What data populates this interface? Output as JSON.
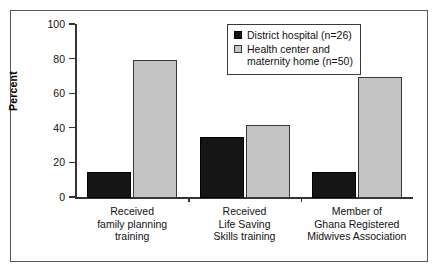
{
  "chart_data": {
    "type": "bar",
    "title": "",
    "xlabel": "",
    "ylabel": "Percent",
    "ylim": [
      0,
      100
    ],
    "yticks": [
      0,
      20,
      40,
      60,
      80,
      100
    ],
    "grid": false,
    "legend_position": "top-right",
    "categories": [
      "Received\nfamily planning\ntraining",
      "Received\nLife Saving\nSkills training",
      "Member of\nGhana Registered\nMidwives Association"
    ],
    "series": [
      {
        "name": "District hospital (n=26)",
        "color": "#151515",
        "values": [
          15,
          35,
          15
        ]
      },
      {
        "name": "Health center and\nmaternity home (n=50)",
        "color": "#c4c4c4",
        "values": [
          80,
          42,
          70
        ]
      }
    ]
  },
  "legend": {
    "entries": [
      {
        "label": "District hospital (n=26)",
        "swatch": "dark-swatch"
      },
      {
        "label": "Health center and\nmaternity home (n=50)",
        "swatch": "light-swatch"
      }
    ]
  },
  "axis": {
    "y_label": "Percent",
    "y_tick_labels": [
      "100",
      "80",
      "60",
      "40",
      "20",
      "0"
    ]
  },
  "colors": {
    "series_dark": "#151515",
    "series_light": "#c4c4c4",
    "frame": "#555555",
    "axis": "#333333",
    "background": "#ffffff"
  }
}
